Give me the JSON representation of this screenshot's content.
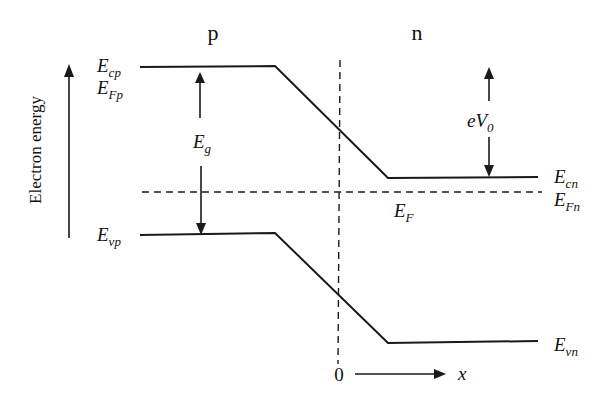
{
  "diagram": {
    "region_labels": {
      "p": "p",
      "n": "n"
    },
    "axis": {
      "y_label": "Electron energy",
      "x_origin": "0",
      "x_label": "x"
    },
    "levels": {
      "Ecp": {
        "main": "E",
        "sub": "cp"
      },
      "EFp": {
        "main": "E",
        "sub": "Fp"
      },
      "Evp": {
        "main": "E",
        "sub": "vp"
      },
      "Ecn": {
        "main": "E",
        "sub": "cn"
      },
      "EFn": {
        "main": "E",
        "sub": "Fn"
      },
      "Evn": {
        "main": "E",
        "sub": "vn"
      },
      "EF": {
        "main": "E",
        "sub": "F"
      }
    },
    "gaps": {
      "Eg": {
        "main": "E",
        "sub": "g"
      },
      "eV0": {
        "main": "eV",
        "sub": "0"
      }
    },
    "colors": {
      "ink": "#1a1a1a",
      "background": "#ffffff"
    }
  }
}
